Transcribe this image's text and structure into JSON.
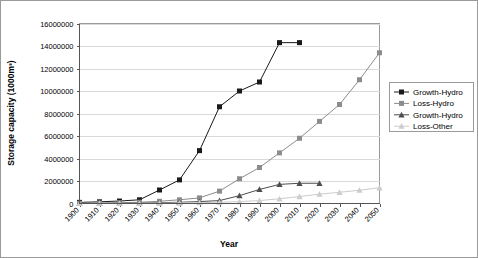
{
  "chart_data": {
    "type": "line",
    "title": "",
    "xlabel": "Year",
    "ylabel": "Storage capacity (1000m³)",
    "xlim": [
      1900,
      2050
    ],
    "ylim": [
      0,
      16000000
    ],
    "grid": true,
    "legend_position": "right",
    "categories": [
      1900,
      1910,
      1920,
      1930,
      1940,
      1950,
      1960,
      1970,
      1980,
      1990,
      2000,
      2010,
      2020,
      2030,
      2040,
      2050
    ],
    "xticks": [
      "1900",
      "1910",
      "1920",
      "1930",
      "1940",
      "1950",
      "1960",
      "1970",
      "1980",
      "1990",
      "2000",
      "2010",
      "2020",
      "2030",
      "2040",
      "2050"
    ],
    "yticks": [
      "0",
      "2000000",
      "4000000",
      "6000000",
      "8000000",
      "10000000",
      "12000000",
      "14000000",
      "16000000"
    ],
    "ytick_values": [
      0,
      2000000,
      4000000,
      6000000,
      8000000,
      10000000,
      12000000,
      14000000,
      16000000
    ],
    "series": [
      {
        "name": "Growth-Hydro",
        "color": "#1a1a1a",
        "marker": "square",
        "x": [
          1900,
          1910,
          1920,
          1930,
          1940,
          1950,
          1960,
          1970,
          1980,
          1990,
          2000,
          2010
        ],
        "values": [
          100000,
          150000,
          220000,
          330000,
          1200000,
          2100000,
          4700000,
          8600000,
          10000000,
          10800000,
          14300000,
          14300000
        ]
      },
      {
        "name": "Loss-Hydro",
        "color": "#8c8c8c",
        "marker": "square",
        "x": [
          1900,
          1910,
          1920,
          1930,
          1940,
          1950,
          1960,
          1970,
          1980,
          1990,
          2000,
          2010,
          2020,
          2030,
          2040,
          2050
        ],
        "values": [
          20000,
          40000,
          70000,
          110000,
          200000,
          330000,
          500000,
          1100000,
          2200000,
          3200000,
          4500000,
          5800000,
          7300000,
          8800000,
          11000000,
          13400000
        ]
      },
      {
        "name": "Growth-Hydro",
        "color": "#4d4d4d",
        "marker": "triangle",
        "x": [
          1900,
          1910,
          1920,
          1930,
          1940,
          1950,
          1960,
          1970,
          1980,
          1990,
          2000,
          2010,
          2020
        ],
        "values": [
          10000,
          15000,
          25000,
          40000,
          70000,
          110000,
          170000,
          260000,
          700000,
          1250000,
          1700000,
          1800000,
          1800000
        ]
      },
      {
        "name": "Loss-Other",
        "color": "#cccccc",
        "marker": "triangle",
        "x": [
          1900,
          1910,
          1920,
          1930,
          1940,
          1950,
          1960,
          1970,
          1980,
          1990,
          2000,
          2010,
          2020,
          2030,
          2040,
          2050
        ],
        "values": [
          5000,
          8000,
          12000,
          18000,
          28000,
          45000,
          70000,
          110000,
          170000,
          260000,
          420000,
          620000,
          830000,
          1000000,
          1180000,
          1400000
        ]
      }
    ]
  },
  "legend": {
    "items": [
      {
        "label": "Growth-Hydro"
      },
      {
        "label": "Loss-Hydro"
      },
      {
        "label": "Growth-Hydro"
      },
      {
        "label": "Loss-Other"
      }
    ]
  }
}
